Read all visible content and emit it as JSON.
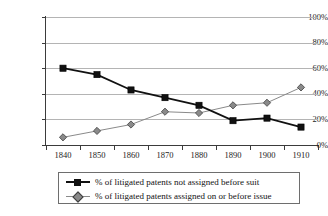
{
  "chart_data": {
    "type": "line",
    "title": "",
    "xlabel": "",
    "ylabel": "",
    "categories": [
      "1840",
      "1850",
      "1860",
      "1870",
      "1880",
      "1890",
      "1900",
      "1910"
    ],
    "x": [
      1840,
      1850,
      1860,
      1870,
      1880,
      1890,
      1900,
      1910
    ],
    "ylim": [
      0,
      100
    ],
    "xlim": [
      1835,
      1915
    ],
    "grid": true,
    "legend_position": "bottom",
    "y_ticks": [
      "0%",
      "20%",
      "40%",
      "60%",
      "80%",
      "100%"
    ],
    "y_tick_values": [
      0,
      20,
      40,
      60,
      80,
      100
    ],
    "series": [
      {
        "name": "% of litigated patents not assigned before suit",
        "marker": "square",
        "color": "#111111",
        "line_color": "#111111",
        "values": [
          60,
          55,
          43,
          37,
          31,
          19,
          21,
          14
        ]
      },
      {
        "name": "% of litigated patents assigned on or before issue",
        "marker": "diamond",
        "color": "#8a8a8a",
        "line_color": "#8a8a8a",
        "values": [
          6,
          11,
          16,
          26,
          25,
          31,
          33,
          45
        ]
      }
    ]
  },
  "legend": {
    "items": [
      {
        "label": "% of litigated patents not assigned before suit"
      },
      {
        "label": "% of litigated patents assigned on or before issue"
      }
    ]
  },
  "colors": {
    "series_dark": "#111111",
    "series_light": "#8a8a8a",
    "gridline": "#b4b4b4",
    "axis": "#3b3b3b",
    "text": "#1b1b1b",
    "background": "#ffffff"
  }
}
